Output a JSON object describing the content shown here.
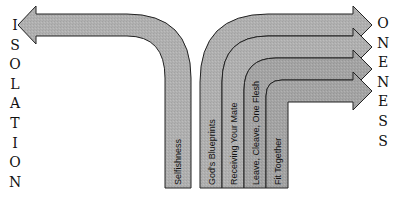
{
  "left_word": {
    "text": "ISOLATION",
    "letters": [
      "I",
      "S",
      "O",
      "L",
      "A",
      "T",
      "I",
      "O",
      "N"
    ]
  },
  "right_word": {
    "text": "ONENESS",
    "letters": [
      "O",
      "N",
      "E",
      "N",
      "E",
      "S",
      "S"
    ]
  },
  "arrows": [
    {
      "label": "Selfishness",
      "direction": "left",
      "target": "ISOLATION"
    },
    {
      "label": "God's Blueprints",
      "direction": "right",
      "target": "ONENESS"
    },
    {
      "label": "Receiving Your Mate",
      "direction": "right",
      "target": "ONENESS"
    },
    {
      "label": "Leave, Cleave, One Flesh",
      "direction": "right",
      "target": "ONENESS"
    },
    {
      "label": "Fit Together",
      "direction": "right",
      "target": "ONENESS"
    }
  ],
  "colors": {
    "arrow_fill": "#b3b3b3",
    "arrow_fill_inner": "#a6a6a6",
    "arrow_stroke": "#222222",
    "text": "#111111"
  }
}
